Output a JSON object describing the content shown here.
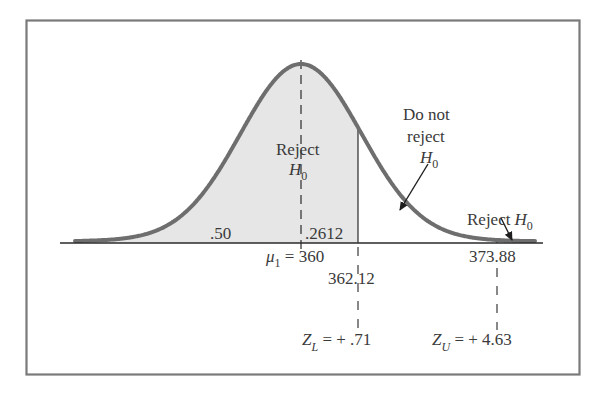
{
  "figure": {
    "colors": {
      "curve": "#6e6e6e",
      "shade": "#e6e6e6",
      "frame": "#7a7a7a",
      "axis": "#2a2a2a",
      "text": "#3a3a3a"
    },
    "labels": {
      "reject_left": "Reject",
      "reject_left_h": "H",
      "reject_left_sub": "0",
      "do_not_1": "Do not",
      "do_not_2": "reject",
      "do_not_h": "H",
      "do_not_sub": "0",
      "reject_right": "Reject",
      "reject_right_h": "H",
      "reject_right_sub": "0",
      "area_left": ".50",
      "area_mid": ".2612",
      "mu_symbol": "μ",
      "mu_sub": "1",
      "mu_value": " = 360",
      "xl_value": "362.12",
      "xu_value": "373.88",
      "zl_symbol": "Z",
      "zl_sub": "L",
      "zl_value": " = + .71",
      "zu_symbol": "Z",
      "zu_sub": "U",
      "zu_value": " = + 4.63"
    }
  },
  "chart_data": {
    "type": "area",
    "title": "",
    "distribution": "normal",
    "mean_label": "μ1 = 360",
    "mean": 360,
    "critical_values": [
      {
        "name": "lower",
        "x": 362.12,
        "z_label": "Z_L = +.71",
        "z": 0.71
      },
      {
        "name": "upper",
        "x": 373.88,
        "z_label": "Z_U = +4.63",
        "z": 4.63
      }
    ],
    "regions": [
      {
        "label": "Reject H0",
        "from": "-inf",
        "to": 362.12,
        "shaded": true,
        "areas": [
          {
            "label": ".50",
            "from": "-inf",
            "to": 360
          },
          {
            "label": ".2612",
            "from": 360,
            "to": 362.12
          }
        ]
      },
      {
        "label": "Do not reject H0",
        "from": 362.12,
        "to": 373.88,
        "shaded": false
      },
      {
        "label": "Reject H0",
        "from": 373.88,
        "to": "inf",
        "shaded": true
      }
    ],
    "annotations": [
      ".50",
      ".2612",
      "Reject H0",
      "Do not reject H0",
      "Reject H0"
    ],
    "xlabel": "",
    "ylabel": "",
    "grid": false
  }
}
